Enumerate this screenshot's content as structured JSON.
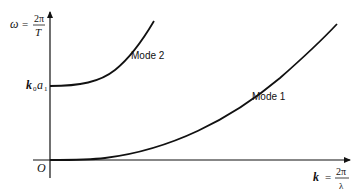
{
  "diagram": {
    "type": "dispersion-relation-plot",
    "y_axis": {
      "label_lhs": "ω",
      "label_eq": "=",
      "label_num": "2π",
      "label_den": "T"
    },
    "x_axis": {
      "label_lhs": "k",
      "label_eq": "=",
      "label_num": "2π",
      "label_den": "λ"
    },
    "origin_label": "O",
    "cutoff_label_main": "k",
    "cutoff_label_sub1": "0",
    "cutoff_label_a": "a",
    "cutoff_label_sub2": "1",
    "curves": [
      {
        "name": "Mode 1",
        "label": "Mode 1",
        "start": "origin",
        "shape": "quadratic-to-linear rising"
      },
      {
        "name": "Mode 2",
        "label": "Mode 2",
        "start": "k0a1 on ω-axis",
        "shape": "rising from cutoff"
      }
    ],
    "colors": {
      "line": "#111111",
      "background": "#ffffff"
    }
  }
}
